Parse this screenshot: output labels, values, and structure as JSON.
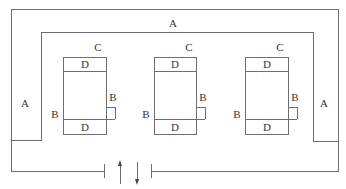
{
  "diagram": {
    "labels": {
      "top_corridor": "A",
      "left_corridor": "A",
      "right_corridor": "A"
    },
    "units": [
      {
        "top_label": "C",
        "top_cell": "D",
        "bottom_cell": "D",
        "left_label": "B",
        "right_label": "B"
      },
      {
        "top_label": "C",
        "top_cell": "D",
        "bottom_cell": "D",
        "left_label": "B",
        "right_label": "B"
      },
      {
        "top_label": "C",
        "top_cell": "D",
        "bottom_cell": "D",
        "left_label": "B",
        "right_label": "B"
      }
    ],
    "entrance": {
      "in_arrow": "up-arrow",
      "out_arrow": "down-arrow"
    },
    "colors": {
      "line": "#6e6e6e",
      "text": "#333333",
      "background": "#ffffff"
    }
  }
}
